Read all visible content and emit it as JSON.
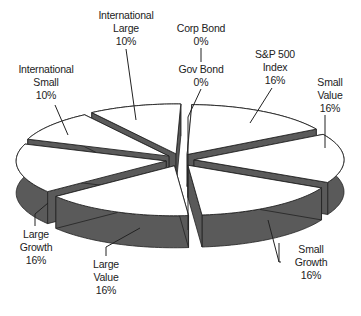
{
  "chart_data": {
    "type": "pie",
    "style": "3d-exploded",
    "title": "",
    "slices": [
      {
        "label": "S&P 500 Index",
        "line1": "S&P 500",
        "line2": "Index",
        "value": 16,
        "pct": "16%"
      },
      {
        "label": "Small Value",
        "line1": "Small",
        "line2": "Value",
        "value": 16,
        "pct": "16%"
      },
      {
        "label": "Small Growth",
        "line1": "Small",
        "line2": "Growth",
        "value": 16,
        "pct": "16%"
      },
      {
        "label": "Large Value",
        "line1": "Large",
        "line2": "Value",
        "value": 16,
        "pct": "16%"
      },
      {
        "label": "Large Growth",
        "line1": "Large",
        "line2": "Growth",
        "value": 16,
        "pct": "16%"
      },
      {
        "label": "International Small",
        "line1": "International",
        "line2": "Small",
        "value": 10,
        "pct": "10%"
      },
      {
        "label": "International Large",
        "line1": "International",
        "line2": "Large",
        "value": 10,
        "pct": "10%"
      },
      {
        "label": "Corp Bond",
        "line1": "Corp Bond",
        "line2": "",
        "value": 0,
        "pct": "0%"
      },
      {
        "label": "Gov Bond",
        "line1": "Gov Bond",
        "line2": "",
        "value": 0,
        "pct": "0%"
      }
    ],
    "colors": {
      "top": "#ffffff",
      "side": "#5a5a5a",
      "outline": "#222222"
    },
    "legend": "none"
  }
}
